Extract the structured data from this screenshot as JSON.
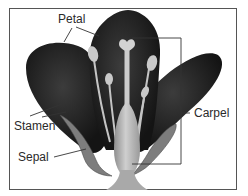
{
  "diagram": {
    "labels": {
      "petal": "Petal",
      "stamen": "Stamen",
      "sepal": "Sepal",
      "carpel": "Carpel"
    },
    "colors": {
      "petal": "#1e1e1e",
      "petal_highlight": "#3a3a3a",
      "carpel": "#a8a8a8",
      "carpel_light": "#c8c8c8",
      "stamen": "#b8b8b8",
      "sepal": "#7a7a7a",
      "leader_line": "#333333",
      "frame": "#555555"
    }
  }
}
